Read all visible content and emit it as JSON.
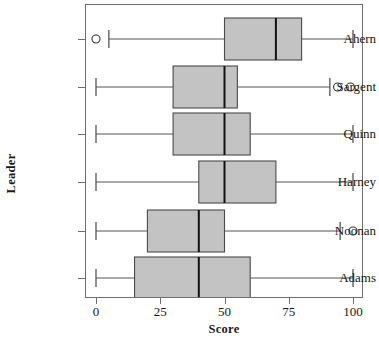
{
  "chart_data": {
    "type": "box",
    "title": "",
    "xlabel": "Score",
    "ylabel": "Leader",
    "xlim": [
      0,
      100
    ],
    "xticks": [
      0,
      25,
      50,
      75,
      100
    ],
    "xtick_labels": [
      "0",
      "25",
      "50",
      "75",
      "100"
    ],
    "grid": false,
    "legend": null,
    "orientation": "horizontal",
    "categories": [
      "Ahern",
      "Sargent",
      "Quinn",
      "Harney",
      "Noonan",
      "Adams"
    ],
    "boxes": [
      {
        "label": "Ahern",
        "whisker_low": 5,
        "q1": 50,
        "median": 70,
        "q3": 80,
        "whisker_high": 100,
        "outliers": [
          0
        ]
      },
      {
        "label": "Sargent",
        "whisker_low": 0,
        "q1": 30,
        "median": 50,
        "q3": 55,
        "whisker_high": 91,
        "outliers": [
          94,
          99
        ]
      },
      {
        "label": "Quinn",
        "whisker_low": 0,
        "q1": 30,
        "median": 50,
        "q3": 60,
        "whisker_high": 100,
        "outliers": []
      },
      {
        "label": "Harney",
        "whisker_low": 0,
        "q1": 40,
        "median": 50,
        "q3": 70,
        "whisker_high": 100,
        "outliers": []
      },
      {
        "label": "Noonan",
        "whisker_low": 0,
        "q1": 20,
        "median": 40,
        "q3": 50,
        "whisker_high": 95,
        "outliers": [
          100
        ]
      },
      {
        "label": "Adams",
        "whisker_low": 0,
        "q1": 15,
        "median": 40,
        "q3": 60,
        "whisker_high": 100,
        "outliers": []
      }
    ],
    "colors": {
      "box_fill": "#c3c3c3",
      "box_edge": "#4a4a4a",
      "median": "#111111",
      "whisker": "#555555",
      "outlier_edge": "#333333",
      "frame": "#6e6e6e",
      "text": "#171717"
    }
  }
}
